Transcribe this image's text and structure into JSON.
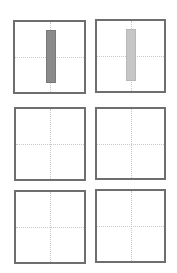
{
  "chart_data": [
    {
      "type": "bar",
      "panel": "row1-col1",
      "title": "",
      "xlabel": "",
      "ylabel": "",
      "grid": true,
      "series": [
        {
          "name": "",
          "values": [
            1
          ],
          "color": "#8a8a8a"
        }
      ],
      "categories": [
        ""
      ],
      "ylim": [
        -1,
        1
      ],
      "bar_extent": [
        -0.75,
        0.75
      ]
    },
    {
      "type": "bar",
      "panel": "row1-col2",
      "title": "",
      "xlabel": "",
      "ylabel": "",
      "grid": true,
      "series": [
        {
          "name": "",
          "values": [
            1
          ],
          "color": "#c6c6c6"
        }
      ],
      "categories": [
        ""
      ],
      "ylim": [
        -1,
        1
      ],
      "bar_extent": [
        -0.75,
        0.75
      ]
    },
    {
      "type": "bar",
      "panel": "row2-col1",
      "title": "",
      "grid": true,
      "series": []
    },
    {
      "type": "bar",
      "panel": "row2-col2",
      "title": "",
      "grid": true,
      "series": []
    },
    {
      "type": "bar",
      "panel": "row3-col1",
      "title": "",
      "grid": true,
      "series": []
    },
    {
      "type": "bar",
      "panel": "row3-col2",
      "title": "",
      "grid": true,
      "series": []
    }
  ],
  "layout": {
    "panels": [
      {
        "x": 13,
        "y": 20,
        "w": 73,
        "h": 74,
        "bar": {
          "x": 46,
          "y": 30,
          "w": 10,
          "h": 53,
          "color": "#8a8a8a",
          "border": "#7a7a7a"
        }
      },
      {
        "x": 95,
        "y": 19,
        "w": 71,
        "h": 74,
        "bar": {
          "x": 126,
          "y": 29,
          "w": 10,
          "h": 52,
          "color": "#c6c6c6",
          "border": "#b8b8b8"
        }
      },
      {
        "x": 14,
        "y": 107,
        "w": 72,
        "h": 74
      },
      {
        "x": 95,
        "y": 107,
        "w": 71,
        "h": 73
      },
      {
        "x": 14,
        "y": 190,
        "w": 72,
        "h": 74
      },
      {
        "x": 95,
        "y": 189,
        "w": 71,
        "h": 74
      }
    ]
  }
}
